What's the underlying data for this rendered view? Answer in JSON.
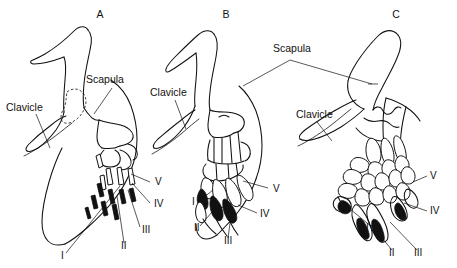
{
  "figure": {
    "background_color": "#ffffff",
    "ink_color": "#111111"
  },
  "panels": [
    {
      "id": "A",
      "letter": "A",
      "letter_x": 100,
      "letter_y": 18,
      "labels": [
        {
          "name": "scapula",
          "text": "Scapula",
          "x": 86,
          "y": 83
        },
        {
          "name": "clavicle",
          "text": "Clavicle",
          "x": 6,
          "y": 111
        }
      ],
      "digits": [
        {
          "numeral": "I",
          "x": 61,
          "y": 259
        },
        {
          "numeral": "II",
          "x": 121,
          "y": 249
        },
        {
          "numeral": "III",
          "x": 142,
          "y": 233
        },
        {
          "numeral": "IV",
          "x": 154,
          "y": 207
        },
        {
          "numeral": "V",
          "x": 155,
          "y": 185
        }
      ]
    },
    {
      "id": "B",
      "letter": "B",
      "letter_x": 226,
      "letter_y": 18,
      "labels": [
        {
          "name": "clavicle",
          "text": "Clavicle",
          "x": 150,
          "y": 96
        }
      ],
      "digits": [
        {
          "numeral": "I",
          "x": 192,
          "y": 205
        },
        {
          "numeral": "II",
          "x": 194,
          "y": 231
        },
        {
          "numeral": "III",
          "x": 224,
          "y": 244
        },
        {
          "numeral": "IV",
          "x": 260,
          "y": 217
        },
        {
          "numeral": "V",
          "x": 273,
          "y": 192
        }
      ]
    },
    {
      "id": "C",
      "letter": "C",
      "letter_x": 396,
      "letter_y": 18,
      "labels": [
        {
          "name": "clavicle",
          "text": "Clavicle",
          "x": 296,
          "y": 118
        }
      ],
      "digits": [
        {
          "numeral": "I",
          "x": 366,
          "y": 231
        },
        {
          "numeral": "II",
          "x": 389,
          "y": 256
        },
        {
          "numeral": "III",
          "x": 414,
          "y": 256
        },
        {
          "numeral": "IV",
          "x": 430,
          "y": 214
        },
        {
          "numeral": "V",
          "x": 430,
          "y": 179
        }
      ]
    }
  ],
  "shared_labels": [
    {
      "name": "scapula-shared",
      "text": "Scapula",
      "x": 273,
      "y": 52
    }
  ],
  "digit_numerals": [
    "I",
    "II",
    "III",
    "IV",
    "V"
  ],
  "bone_names": [
    "Scapula",
    "Clavicle"
  ]
}
